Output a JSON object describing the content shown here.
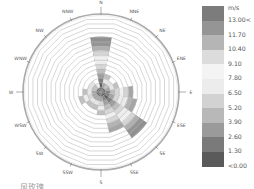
{
  "chart_data": {
    "type": "wind_rose",
    "title": "",
    "directions": [
      "N",
      "NNE",
      "NE",
      "ENE",
      "E",
      "ESE",
      "SE",
      "SSE",
      "S",
      "SSW",
      "SW",
      "WSW",
      "W",
      "WNW",
      "NW",
      "NNW"
    ],
    "ring_count": 16,
    "legend": {
      "unit": "m/s",
      "bins": [
        "<0.00",
        "1.30",
        "2.60",
        "3.90",
        "5.20",
        "6.50",
        "7.80",
        "9.10",
        "10.40",
        "11.70",
        "13.00<"
      ],
      "colors": [
        "#5a5a5a",
        "#7a7a7a",
        "#9a9a9a",
        "#b8b8b8",
        "#d2d2d2",
        "#ececec",
        "#f4f4f4",
        "#dcdcdc",
        "#b5b5b5",
        "#959595",
        "#7c7c7c"
      ]
    },
    "series": [
      {
        "direction": "N",
        "extent_rings": 12
      },
      {
        "direction": "NNE",
        "extent_rings": 4
      },
      {
        "direction": "NE",
        "extent_rings": 3
      },
      {
        "direction": "ENE",
        "extent_rings": 4
      },
      {
        "direction": "E",
        "extent_rings": 7
      },
      {
        "direction": "ESE",
        "extent_rings": 8
      },
      {
        "direction": "SE",
        "extent_rings": 12
      },
      {
        "direction": "SSE",
        "extent_rings": 9
      },
      {
        "direction": "S",
        "extent_rings": 5
      },
      {
        "direction": "SSW",
        "extent_rings": 4
      },
      {
        "direction": "SW",
        "extent_rings": 4
      },
      {
        "direction": "WSW",
        "extent_rings": 5
      },
      {
        "direction": "W",
        "extent_rings": 4
      },
      {
        "direction": "WNW",
        "extent_rings": 3
      },
      {
        "direction": "NW",
        "extent_rings": 3
      },
      {
        "direction": "NNW",
        "extent_rings": 2
      }
    ]
  },
  "legend": {
    "unit": "m/s",
    "labels": [
      "13.00<",
      "11.70",
      "10.40",
      "9.10",
      "7.80",
      "6.50",
      "5.20",
      "3.90",
      "2.60",
      "1.30",
      "<0.00"
    ]
  },
  "caption": "风玫瑰"
}
